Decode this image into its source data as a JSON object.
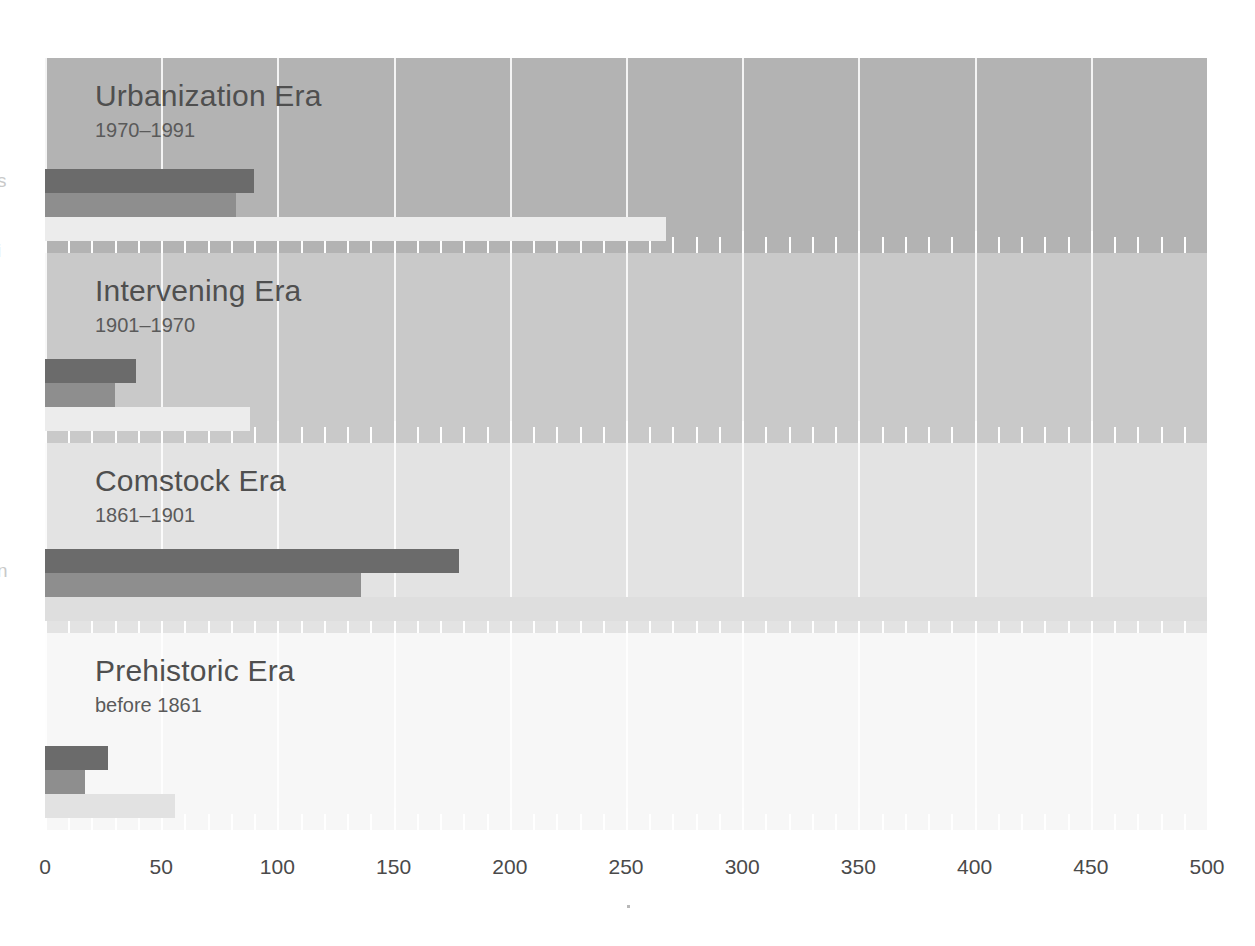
{
  "chart_data": {
    "type": "bar",
    "orientation": "horizontal",
    "title": "",
    "subtitle": "",
    "xlabel": "",
    "ylabel": "",
    "xlim": [
      0,
      500
    ],
    "xticks": [
      0,
      50,
      100,
      150,
      200,
      250,
      300,
      350,
      400,
      450,
      500
    ],
    "xtick_labels": [
      "0",
      "50",
      "100",
      "150",
      "200",
      "250",
      "300",
      "350",
      "400",
      "450",
      "500"
    ],
    "minor_tick_step": 10,
    "grid": true,
    "legend": "none",
    "categories": [
      "Urbanization Era",
      "Intervening Era",
      "Comstock Era",
      "Prehistoric Era"
    ],
    "category_ranges": [
      "1970–1991",
      "1901–1970",
      "1861–1901",
      "before 1861"
    ],
    "series": [
      {
        "name": "dark",
        "color": "#6b6b6b",
        "values": [
          90,
          39,
          178,
          27
        ]
      },
      {
        "name": "medium",
        "color": "#8e8e8e",
        "values": [
          82,
          30,
          136,
          17
        ]
      },
      {
        "name": "light",
        "color": "#e7e7e7",
        "values": [
          267,
          88,
          500,
          56
        ]
      }
    ],
    "bands": [
      {
        "id": "urbanization",
        "title": "Urbanization Era",
        "range": "1970–1991",
        "background": "#b3b3b3",
        "top": 0,
        "height": 195,
        "bars": [
          {
            "series": "dark",
            "value": 90,
            "color": "#6b6b6b"
          },
          {
            "series": "medium",
            "value": 82,
            "color": "#8e8e8e"
          },
          {
            "series": "light",
            "value": 267,
            "color": "#ececec"
          }
        ]
      },
      {
        "id": "intervening",
        "title": "Intervening Era",
        "range": "1901–1970",
        "background": "#c9c9c9",
        "top": 195,
        "height": 190,
        "bars": [
          {
            "series": "dark",
            "value": 39,
            "color": "#6b6b6b"
          },
          {
            "series": "medium",
            "value": 30,
            "color": "#8e8e8e"
          },
          {
            "series": "light",
            "value": 88,
            "color": "#ececec"
          }
        ]
      },
      {
        "id": "comstock",
        "title": "Comstock Era",
        "range": "1861–1901",
        "background": "#e3e3e3",
        "top": 385,
        "height": 190,
        "bars": [
          {
            "series": "dark",
            "value": 178,
            "color": "#6b6b6b"
          },
          {
            "series": "medium",
            "value": 136,
            "color": "#8e8e8e"
          },
          {
            "series": "light",
            "value": 500,
            "color": "#dedede"
          }
        ]
      },
      {
        "id": "prehistoric",
        "title": "Prehistoric Era",
        "range": "before 1861",
        "background": "#f7f7f7",
        "top": 575,
        "height": 197,
        "bars": [
          {
            "series": "dark",
            "value": 27,
            "color": "#6b6b6b"
          },
          {
            "series": "medium",
            "value": 17,
            "color": "#8e8e8e"
          },
          {
            "series": "light",
            "value": 56,
            "color": "#e2e2e2"
          }
        ]
      }
    ]
  },
  "colors": {
    "dark_bar": "#6b6b6b",
    "medium_bar": "#8e8e8e",
    "light_bar": "#e7e7e7",
    "gridline": "#ffffff",
    "text": "#4a4a4a",
    "page_background": "#ffffff"
  },
  "edge_fragments": [
    {
      "text": "s",
      "top": 170
    },
    {
      "text": "i",
      "top": 240
    },
    {
      "text": "n",
      "top": 560
    }
  ]
}
